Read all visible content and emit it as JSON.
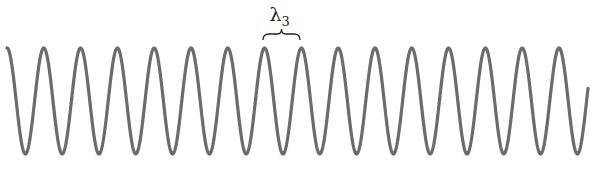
{
  "diagram": {
    "title": "",
    "wave": {
      "type": "sine",
      "color": "#6b6b6b",
      "stroke_width": 3.2,
      "x_start": 7,
      "x_end": 588,
      "y_top": 48,
      "y_bottom": 154,
      "period_px": 36.8,
      "phase_start": "peak"
    },
    "annotation": {
      "symbol": "λ",
      "subscript": "3",
      "brace_x_start": 263,
      "brace_x_end": 300,
      "brace_y": 34,
      "color": "#222222"
    }
  }
}
